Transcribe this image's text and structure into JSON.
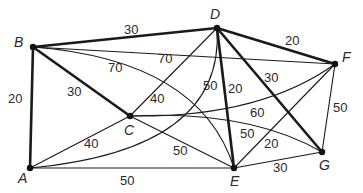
{
  "graph": {
    "nodes": [
      {
        "id": "A",
        "label": "A"
      },
      {
        "id": "B",
        "label": "B"
      },
      {
        "id": "C",
        "label": "C"
      },
      {
        "id": "D",
        "label": "D"
      },
      {
        "id": "E",
        "label": "E"
      },
      {
        "id": "F",
        "label": "F"
      },
      {
        "id": "G",
        "label": "G"
      }
    ],
    "edges": [
      {
        "from": "B",
        "to": "D",
        "weight": "30",
        "bold": true
      },
      {
        "from": "B",
        "to": "A",
        "weight": "20",
        "bold": true
      },
      {
        "from": "B",
        "to": "C",
        "weight": "30",
        "bold": true
      },
      {
        "from": "B",
        "to": "F",
        "weight": "70",
        "bold": false
      },
      {
        "from": "B",
        "to": "E",
        "weight": "70",
        "bold": false,
        "curved": true
      },
      {
        "from": "D",
        "to": "F",
        "weight": "20",
        "bold": true
      },
      {
        "from": "D",
        "to": "C",
        "weight": "40",
        "bold": false
      },
      {
        "from": "D",
        "to": "A",
        "weight": "50",
        "bold": false,
        "curved": true
      },
      {
        "from": "D",
        "to": "E",
        "weight": "20",
        "bold": true
      },
      {
        "from": "D",
        "to": "G",
        "weight": "30",
        "bold": true
      },
      {
        "from": "C",
        "to": "F",
        "weight": "60",
        "bold": false,
        "curved": true
      },
      {
        "from": "C",
        "to": "G",
        "weight": "50",
        "bold": false,
        "curved": true
      },
      {
        "from": "C",
        "to": "E",
        "weight": "50",
        "bold": false
      },
      {
        "from": "A",
        "to": "C",
        "weight": "40",
        "bold": false
      },
      {
        "from": "A",
        "to": "E",
        "weight": "50",
        "bold": false
      },
      {
        "from": "E",
        "to": "F",
        "weight": "20",
        "bold": false
      },
      {
        "from": "E",
        "to": "G",
        "weight": "30",
        "bold": false
      },
      {
        "from": "F",
        "to": "G",
        "weight": "50",
        "bold": false
      }
    ]
  }
}
